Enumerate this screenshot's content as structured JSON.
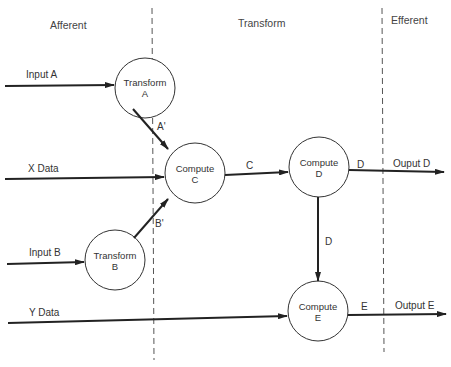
{
  "regions": [
    {
      "id": "afferent",
      "label": "Afferent"
    },
    {
      "id": "transform",
      "label": "Transform"
    },
    {
      "id": "efferent",
      "label": "Efferent"
    }
  ],
  "nodes": [
    {
      "id": "transform-a",
      "line1": "Transform",
      "line2": "A"
    },
    {
      "id": "compute-c",
      "line1": "Compute",
      "line2": "C"
    },
    {
      "id": "transform-b",
      "line1": "Transform",
      "line2": "B"
    },
    {
      "id": "compute-d",
      "line1": "Compute",
      "line2": "D"
    },
    {
      "id": "compute-e",
      "line1": "Compute",
      "line2": "E"
    }
  ],
  "edges": {
    "input_a": "Input A",
    "x_data": "X Data",
    "input_b": "Input B",
    "y_data": "Y Data",
    "a_prime": "A'",
    "b_prime": "B'",
    "c": "C",
    "d_right": "D",
    "d_down": "D",
    "e": "E",
    "output_d": "Ouput D",
    "output_e": "Output E"
  },
  "colors": {
    "line": "#222222",
    "dashed": "#555555",
    "text": "#333333"
  }
}
